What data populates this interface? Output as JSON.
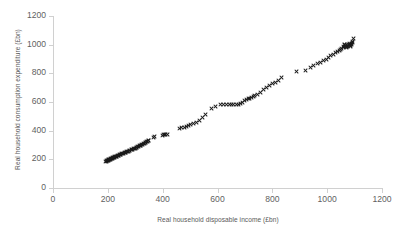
{
  "chart_data": {
    "type": "scatter",
    "title": "",
    "xlabel": "Real household disposable income (£bn)",
    "ylabel": "Real household consumption expenditure (£bn)",
    "xlim": [
      0,
      1200
    ],
    "ylim": [
      0,
      1200
    ],
    "xticks": [
      0,
      200,
      400,
      600,
      800,
      1000,
      1200
    ],
    "yticks": [
      0,
      200,
      400,
      600,
      800,
      1000,
      1200
    ],
    "xtick_labels": [
      "0",
      "200",
      "400",
      "600",
      "800",
      "1000",
      "1200"
    ],
    "ytick_labels": [
      "0",
      "200",
      "400",
      "600",
      "800",
      "1000",
      "1200"
    ],
    "grid": false,
    "legend": null,
    "marker": "x",
    "marker_color": "#1a1a1a",
    "axis_color": "#d0d0d0",
    "text_color": "#5a5a5a",
    "series": [
      {
        "name": "Household income vs consumption",
        "points": [
          [
            193,
            186
          ],
          [
            195,
            188
          ],
          [
            196,
            190
          ],
          [
            198,
            191
          ],
          [
            199,
            193
          ],
          [
            201,
            194
          ],
          [
            202,
            196
          ],
          [
            204,
            197
          ],
          [
            205,
            199
          ],
          [
            207,
            200
          ],
          [
            209,
            202
          ],
          [
            210,
            203
          ],
          [
            212,
            205
          ],
          [
            214,
            206
          ],
          [
            216,
            208
          ],
          [
            218,
            210
          ],
          [
            220,
            212
          ],
          [
            222,
            213
          ],
          [
            224,
            215
          ],
          [
            226,
            217
          ],
          [
            228,
            219
          ],
          [
            231,
            221
          ],
          [
            233,
            223
          ],
          [
            235,
            225
          ],
          [
            238,
            227
          ],
          [
            240,
            229
          ],
          [
            243,
            231
          ],
          [
            245,
            233
          ],
          [
            248,
            236
          ],
          [
            251,
            238
          ],
          [
            254,
            240
          ],
          [
            257,
            243
          ],
          [
            260,
            245
          ],
          [
            263,
            248
          ],
          [
            266,
            250
          ],
          [
            269,
            253
          ],
          [
            272,
            255
          ],
          [
            275,
            258
          ],
          [
            278,
            260
          ],
          [
            281,
            263
          ],
          [
            285,
            266
          ],
          [
            288,
            268
          ],
          [
            291,
            271
          ],
          [
            294,
            274
          ],
          [
            297,
            277
          ],
          [
            300,
            279
          ],
          [
            303,
            282
          ],
          [
            306,
            285
          ],
          [
            309,
            288
          ],
          [
            312,
            291
          ],
          [
            315,
            294
          ],
          [
            318,
            297
          ],
          [
            321,
            300
          ],
          [
            324,
            303
          ],
          [
            327,
            306
          ],
          [
            330,
            310
          ],
          [
            333,
            313
          ],
          [
            336,
            316
          ],
          [
            339,
            319
          ],
          [
            342,
            322
          ],
          [
            345,
            325
          ],
          [
            347,
            328
          ],
          [
            350,
            331
          ],
          [
            365,
            352
          ],
          [
            372,
            358
          ],
          [
            400,
            368
          ],
          [
            404,
            370
          ],
          [
            408,
            371
          ],
          [
            412,
            372
          ],
          [
            416,
            373
          ],
          [
            462,
            415
          ],
          [
            470,
            420
          ],
          [
            478,
            425
          ],
          [
            486,
            432
          ],
          [
            494,
            438
          ],
          [
            502,
            444
          ],
          [
            512,
            452
          ],
          [
            522,
            460
          ],
          [
            534,
            473
          ],
          [
            546,
            490
          ],
          [
            556,
            510
          ],
          [
            578,
            552
          ],
          [
            592,
            568
          ],
          [
            610,
            580
          ],
          [
            622,
            584
          ],
          [
            634,
            585
          ],
          [
            644,
            585
          ],
          [
            652,
            584
          ],
          [
            660,
            584
          ],
          [
            668,
            583
          ],
          [
            676,
            586
          ],
          [
            684,
            592
          ],
          [
            692,
            600
          ],
          [
            700,
            608
          ],
          [
            706,
            616
          ],
          [
            712,
            622
          ],
          [
            718,
            626
          ],
          [
            724,
            632
          ],
          [
            730,
            638
          ],
          [
            736,
            644
          ],
          [
            746,
            652
          ],
          [
            756,
            666
          ],
          [
            768,
            684
          ],
          [
            778,
            700
          ],
          [
            790,
            712
          ],
          [
            800,
            726
          ],
          [
            812,
            736
          ],
          [
            824,
            752
          ],
          [
            834,
            768
          ],
          [
            888,
            810
          ],
          [
            920,
            818
          ],
          [
            938,
            840
          ],
          [
            952,
            852
          ],
          [
            964,
            868
          ],
          [
            976,
            878
          ],
          [
            986,
            890
          ],
          [
            996,
            900
          ],
          [
            1006,
            912
          ],
          [
            1014,
            922
          ],
          [
            1022,
            932
          ],
          [
            1030,
            942
          ],
          [
            1038,
            952
          ],
          [
            1044,
            960
          ],
          [
            1050,
            966
          ],
          [
            1054,
            975
          ],
          [
            1058,
            980
          ],
          [
            1060,
            990
          ],
          [
            1062,
            998
          ],
          [
            1064,
            1002
          ],
          [
            1066,
            985
          ],
          [
            1068,
            992
          ],
          [
            1070,
            978
          ],
          [
            1072,
            984
          ],
          [
            1074,
            995
          ],
          [
            1076,
            988
          ],
          [
            1078,
            999
          ],
          [
            1080,
            1004
          ],
          [
            1082,
            1010
          ],
          [
            1084,
            996
          ],
          [
            1086,
            990
          ],
          [
            1088,
            1000
          ],
          [
            1090,
            1008
          ],
          [
            1092,
            1016
          ],
          [
            1094,
            1022
          ],
          [
            1096,
            1040
          ]
        ]
      }
    ]
  }
}
